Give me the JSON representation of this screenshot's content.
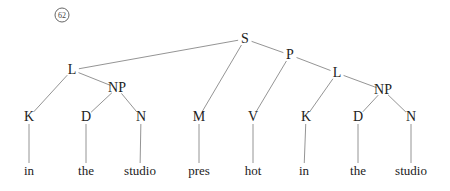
{
  "example_number": "62",
  "nodes": {
    "S": {
      "label": "S",
      "x": 245,
      "y": 39
    },
    "L1": {
      "label": "L",
      "x": 72,
      "y": 70
    },
    "NP1": {
      "label": "NP",
      "x": 117,
      "y": 88
    },
    "P": {
      "label": "P",
      "x": 290,
      "y": 55
    },
    "L2": {
      "label": "L",
      "x": 337,
      "y": 73
    },
    "NP2": {
      "label": "NP",
      "x": 383,
      "y": 90
    },
    "K1": {
      "label": "K",
      "x": 29,
      "y": 117
    },
    "D1": {
      "label": "D",
      "x": 86,
      "y": 117
    },
    "N1": {
      "label": "N",
      "x": 141,
      "y": 117
    },
    "M": {
      "label": "M",
      "x": 199,
      "y": 117
    },
    "V": {
      "label": "V",
      "x": 253,
      "y": 117
    },
    "K2": {
      "label": "K",
      "x": 306,
      "y": 117
    },
    "D2": {
      "label": "D",
      "x": 358,
      "y": 117
    },
    "N2": {
      "label": "N",
      "x": 411,
      "y": 117
    }
  },
  "words": [
    {
      "text": "in",
      "x": 29,
      "y": 170
    },
    {
      "text": "the",
      "x": 86,
      "y": 170
    },
    {
      "text": "studio",
      "x": 140,
      "y": 170
    },
    {
      "text": "pres",
      "x": 199,
      "y": 170
    },
    {
      "text": "hot",
      "x": 253,
      "y": 170
    },
    {
      "text": "in",
      "x": 304,
      "y": 170
    },
    {
      "text": "the",
      "x": 358,
      "y": 170
    },
    {
      "text": "studio",
      "x": 411,
      "y": 170
    }
  ],
  "edges": [
    [
      "S",
      "L1"
    ],
    [
      "S",
      "M"
    ],
    [
      "S",
      "P"
    ],
    [
      "L1",
      "K1"
    ],
    [
      "L1",
      "NP1"
    ],
    [
      "NP1",
      "D1"
    ],
    [
      "NP1",
      "N1"
    ],
    [
      "P",
      "V"
    ],
    [
      "P",
      "L2"
    ],
    [
      "L2",
      "K2"
    ],
    [
      "L2",
      "NP2"
    ],
    [
      "NP2",
      "D2"
    ],
    [
      "NP2",
      "N2"
    ]
  ],
  "leaf_edges": [
    [
      "K1",
      0
    ],
    [
      "D1",
      1
    ],
    [
      "N1",
      2
    ],
    [
      "M",
      3
    ],
    [
      "V",
      4
    ],
    [
      "K2",
      5
    ],
    [
      "D2",
      6
    ],
    [
      "N2",
      7
    ]
  ],
  "line_color": "#888888"
}
